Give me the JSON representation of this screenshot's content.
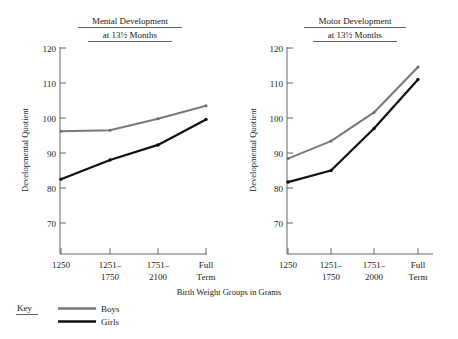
{
  "figure": {
    "xlabel": "Birth Weight Groups in Grams",
    "ylabel": "Developmental Quotient",
    "legend": {
      "key_label": "Key",
      "entries": [
        {
          "name": "Boys",
          "color": "#7a7a7a"
        },
        {
          "name": "Girls",
          "color": "#111111"
        }
      ]
    }
  },
  "chart_data": [
    {
      "type": "line",
      "title": "Mental Development",
      "subtitle": "at 13½ Months",
      "xlabel": "Birth Weight Groups in Grams",
      "ylabel": "Developmental Quotient",
      "categories": [
        "1250",
        "1251–1750",
        "1751–2100",
        "Full Term"
      ],
      "tick_labels": [
        [
          "1250",
          ""
        ],
        [
          "1251–",
          "1750"
        ],
        [
          "1751–",
          "2100"
        ],
        [
          "Full",
          "Term"
        ]
      ],
      "yticks": [
        70,
        80,
        90,
        100,
        110,
        120
      ],
      "ylim": [
        63,
        120
      ],
      "grid": false,
      "legend_position": "below-figure-left",
      "series": [
        {
          "name": "Boys",
          "color": "#7a7a7a",
          "values": [
            96.2,
            96.5,
            99.8,
            103.5
          ]
        },
        {
          "name": "Girls",
          "color": "#111111",
          "values": [
            82.5,
            88.0,
            92.3,
            99.6
          ]
        }
      ]
    },
    {
      "type": "line",
      "title": "Motor Development",
      "subtitle": "at 13½ Months",
      "xlabel": "Birth Weight Groups in Grams",
      "ylabel": "Developmental Quotient",
      "categories": [
        "1250",
        "1251–1750",
        "1751–2000",
        "Full Term"
      ],
      "tick_labels": [
        [
          "1250",
          ""
        ],
        [
          "1251–",
          "1750"
        ],
        [
          "1751–",
          "2000"
        ],
        [
          "Full",
          "Term"
        ]
      ],
      "yticks": [
        70,
        80,
        90,
        100,
        110,
        120
      ],
      "ylim": [
        63,
        120
      ],
      "grid": false,
      "legend_position": "below-figure-left",
      "series": [
        {
          "name": "Boys",
          "color": "#7a7a7a",
          "values": [
            88.4,
            93.4,
            101.6,
            114.6
          ]
        },
        {
          "name": "Girls",
          "color": "#111111",
          "values": [
            81.7,
            85.0,
            97.0,
            111.0
          ]
        }
      ]
    }
  ],
  "labels": {
    "chart1_title": "Mental Development",
    "chart1_subtitle": "at 13½ Months",
    "chart2_title": "Motor Development",
    "chart2_subtitle": "at 13½ Months",
    "y_tick_120": "120",
    "y_tick_110": "110",
    "y_tick_100": "100",
    "y_tick_90": "90",
    "y_tick_80": "80",
    "y_tick_70": "70"
  }
}
